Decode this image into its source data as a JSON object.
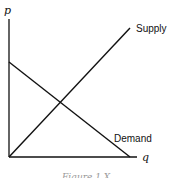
{
  "diagram": {
    "type": "supply-demand",
    "y_axis_label": "p",
    "x_axis_label": "q",
    "curves": [
      {
        "name": "Supply",
        "label": "Supply",
        "from": [
          0,
          0
        ],
        "to": [
          1,
          1
        ]
      },
      {
        "name": "Demand",
        "label": "Demand",
        "from": [
          0,
          0.7
        ],
        "to": [
          1,
          0
        ]
      }
    ],
    "caption": "Figure 1.X",
    "line_color": "#111111"
  }
}
